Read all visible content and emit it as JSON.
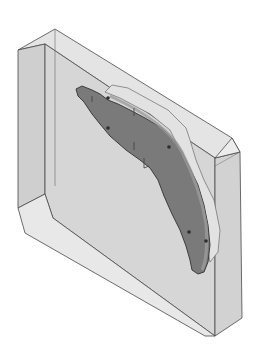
{
  "scene": {
    "description": "Isometric CAD render of a translucent rectangular mold block with chamfered corners containing a curved dark-gray molded part",
    "background": "#ffffff",
    "colors": {
      "block_front": "#d6d6d6",
      "block_top": "#e4e4e4",
      "block_side": "#cfcfcf",
      "block_chamfer": "#e8e8e8",
      "edge": "#4a4a4a",
      "part_face": "#7a7a7a",
      "part_rim": "#9c9c9c",
      "part_boss": "#e2e2e2",
      "part_outline": "#3c3c3c",
      "hole": "#2e2e2e"
    },
    "block": {
      "top_face": "18,50 55,29 232,138 240,152 215,158 45,44",
      "left_face": "18,50 45,44 45,194 18,208",
      "front_face": "45,44 215,158 215,336 53,218 45,194",
      "right_face": "215,158 240,152 242,318 215,336",
      "bottom_chamfer": "18,208 45,194 53,218 215,336 205,336 25,233",
      "right_chamfer": "215,158 232,138 240,152"
    },
    "part": {
      "boss": "105,92 112,85 128,88 168,110 186,128 190,140 196,160 204,180 214,200 220,230 218,252 210,262 206,240 200,210 190,180 180,150 170,130 150,114 120,98",
      "body": "76,89 82,86 92,90 100,94 108,100 118,104 130,110 145,118 162,128 174,140 182,152 190,168 198,185 204,205 208,225 210,245 208,262 204,272 198,274 192,270 190,260 186,246 180,230 172,214 164,196 158,180 150,168 140,160 126,150 110,136 100,124 92,114 84,102 78,96",
      "holes": [
        [
          108,
          98
        ],
        [
          108,
          128
        ],
        [
          169,
          147
        ],
        [
          189,
          232
        ],
        [
          206,
          241
        ]
      ],
      "axis_marker": {
        "x": 144,
        "y": 163
      }
    }
  }
}
